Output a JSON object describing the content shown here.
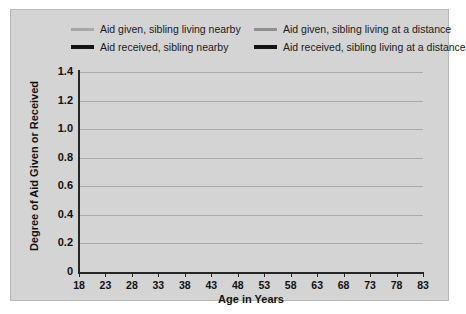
{
  "chart_data": {
    "type": "line",
    "title": "",
    "xlabel": "Age in Years",
    "ylabel": "Degree of Aid Given or Received",
    "xlim": [
      18,
      83
    ],
    "ylim": [
      0,
      1.4
    ],
    "grid": true,
    "legend_position": "top",
    "xticks": [
      18,
      23,
      28,
      33,
      38,
      43,
      48,
      53,
      58,
      63,
      68,
      73,
      78,
      83
    ],
    "xtick_labels": [
      "18",
      "23",
      "28",
      "33",
      "38",
      "43",
      "48",
      "53",
      "58",
      "63",
      "68",
      "73",
      "78",
      "83"
    ],
    "yticks": [
      0,
      0.2,
      0.4,
      0.6,
      0.8,
      1.0,
      1.2,
      1.4
    ],
    "ytick_labels": [
      "0",
      "0.2",
      "0.4",
      "0.6",
      "0.8",
      "1.0",
      "1.2",
      "1.4"
    ],
    "x": [
      18,
      23,
      28,
      33,
      38,
      43,
      48,
      53,
      58,
      63,
      68,
      73,
      78,
      83
    ],
    "series": [
      {
        "name": "Aid given, sibling living nearby",
        "color": "#a8a8a8",
        "width": 3.0,
        "values": [
          1.09,
          1.15,
          1.13,
          1.06,
          0.95,
          0.81,
          0.66,
          0.5,
          0.36,
          0.24,
          0.17,
          0.18,
          0.27,
          0.42
        ]
      },
      {
        "name": "Aid given, sibling living at a distance",
        "color": "#8f8f8f",
        "width": 3.0,
        "values": [
          0.75,
          0.77,
          0.75,
          0.7,
          0.62,
          0.53,
          0.43,
          0.33,
          0.24,
          0.16,
          0.11,
          0.1,
          0.11,
          0.13
        ]
      },
      {
        "name": "Aid received, sibling nearby",
        "color": "#141414",
        "width": 3.4,
        "values": [
          0.75,
          0.78,
          0.78,
          0.75,
          0.7,
          0.63,
          0.54,
          0.44,
          0.34,
          0.24,
          0.17,
          0.17,
          0.25,
          0.4
        ]
      },
      {
        "name": "Aid received, sibling living at a distance",
        "color": "#3a3a3a",
        "width": 3.0,
        "values": [
          0.43,
          0.43,
          0.42,
          0.4,
          0.37,
          0.34,
          0.3,
          0.26,
          0.22,
          0.17,
          0.13,
          0.11,
          0.11,
          0.12
        ]
      }
    ]
  },
  "legend": {
    "entries": [
      {
        "label": "Aid given, sibling living nearby",
        "color": "#a8a8a8",
        "thick": false
      },
      {
        "label": "Aid given, sibling living at a distance",
        "color": "#8f8f8f",
        "thick": false
      },
      {
        "label": "Aid received, sibling nearby",
        "color": "#141414",
        "thick": true
      },
      {
        "label": "Aid received, sibling living at a distance",
        "color": "#141414",
        "thick": true
      }
    ]
  }
}
